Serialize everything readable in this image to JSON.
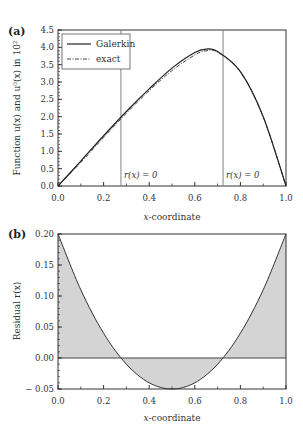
{
  "chart_data": [
    {
      "panel": "(a)",
      "type": "line",
      "xlabel": "x-coordinate",
      "ylabel": "Function u(x) and u⁰(x) in 10²",
      "xlim": [
        0.0,
        1.0
      ],
      "ylim": [
        0.0,
        4.5
      ],
      "xticks": [
        "0.0",
        "0.2",
        "0.4",
        "0.6",
        "0.8",
        "1.0"
      ],
      "yticks": [
        "0.0",
        "0.5",
        "1.0",
        "1.5",
        "2.0",
        "2.5",
        "3.0",
        "3.5",
        "4.0",
        "4.5"
      ],
      "legend": {
        "position": "upper left",
        "entries": [
          "Galerkin",
          "exact"
        ]
      },
      "series": [
        {
          "name": "Galerkin",
          "style": "solid",
          "x": [
            0.0,
            0.1,
            0.2,
            0.3,
            0.4,
            0.5,
            0.6,
            0.65,
            0.7,
            0.8,
            0.9,
            1.0
          ],
          "values": [
            0.0,
            0.72,
            1.45,
            2.15,
            2.8,
            3.4,
            3.85,
            3.95,
            3.88,
            3.3,
            2.0,
            0.0
          ]
        },
        {
          "name": "exact",
          "style": "dash-dot",
          "x": [
            0.0,
            0.1,
            0.2,
            0.3,
            0.4,
            0.5,
            0.6,
            0.65,
            0.7,
            0.8,
            0.9,
            1.0
          ],
          "values": [
            0.0,
            0.68,
            1.4,
            2.1,
            2.75,
            3.33,
            3.78,
            3.9,
            3.86,
            3.3,
            2.0,
            0.0
          ]
        }
      ],
      "vlines": [
        0.276,
        0.724
      ],
      "annotations": [
        "r(x) = 0",
        "r(x) = 0"
      ]
    },
    {
      "panel": "(b)",
      "type": "area",
      "xlabel": "x-coordinate",
      "ylabel": "Residual r(x)",
      "xlim": [
        0.0,
        1.0
      ],
      "ylim": [
        -0.05,
        0.2
      ],
      "xticks": [
        "0.0",
        "0.2",
        "0.4",
        "0.6",
        "0.8",
        "1.0"
      ],
      "yticks": [
        "-0.05",
        "0.00",
        "0.05",
        "0.10",
        "0.15",
        "0.20"
      ],
      "series": [
        {
          "name": "Residual r(x)",
          "style": "solid, filled gray to zero",
          "x": [
            0.0,
            0.1,
            0.2,
            0.3,
            0.4,
            0.5,
            0.6,
            0.7,
            0.8,
            0.9,
            1.0
          ],
          "values": [
            0.2,
            0.11,
            0.04,
            -0.01,
            -0.04,
            -0.05,
            -0.04,
            -0.01,
            0.04,
            0.11,
            0.2
          ]
        }
      ]
    }
  ],
  "labels": {
    "panel_a": "(a)",
    "panel_b": "(b)",
    "xlabel_a": "-coordinate",
    "xlabel_b": "-coordinate",
    "x_var": "x",
    "ylabel_a": "Function u(x) and u⁰(x) in 10²",
    "ylabel_b": "Residual r(x)",
    "legend_galerkin": "Galerkin",
    "legend_exact": "exact",
    "annot_1": "r(x) = 0",
    "annot_2": "r(x) = 0"
  },
  "colors": {
    "curve": "#222222",
    "axis": "#333333",
    "fill": "#d4d4d4",
    "vline": "#777777"
  }
}
